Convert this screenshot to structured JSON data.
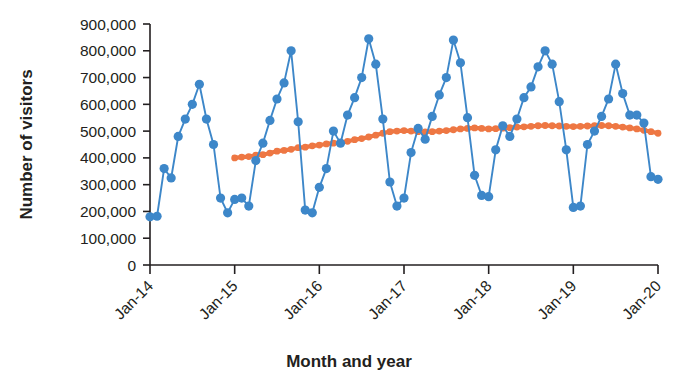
{
  "chart_data": {
    "type": "line",
    "title": "",
    "xlabel": "Month and year",
    "ylabel": "Number of visitors",
    "ylim": [
      0,
      900000
    ],
    "ytick_values": [
      0,
      100000,
      200000,
      300000,
      400000,
      500000,
      600000,
      700000,
      800000,
      900000
    ],
    "ytick_labels": [
      "0",
      "100,000",
      "200,000",
      "300,000",
      "400,000",
      "500,000",
      "600,000",
      "700,000",
      "800,000",
      "900,000"
    ],
    "xtick_labels": [
      "Jan-14",
      "Jan-15",
      "Jan-16",
      "Jan-17",
      "Jan-18",
      "Jan-19",
      "Jan-20"
    ],
    "xtick_indices": [
      0,
      12,
      24,
      36,
      48,
      60,
      72
    ],
    "grid": false,
    "legend": "none",
    "x_start_label": "Jan-14",
    "x_end_label": "Jan-20",
    "colors": {
      "series_visitors": "#3d87c9",
      "series_trend": "#ee7743",
      "axis": "#231f20",
      "background": "#ffffff"
    },
    "series": [
      {
        "name": "Number of visitors",
        "type": "line-marker",
        "color": "#3d87c9",
        "marker": "circle",
        "values": [
          180000,
          182000,
          360000,
          325000,
          480000,
          545000,
          600000,
          675000,
          545000,
          450000,
          250000,
          195000,
          245000,
          250000,
          220000,
          390000,
          455000,
          540000,
          620000,
          680000,
          800000,
          535000,
          205000,
          195000,
          290000,
          360000,
          500000,
          455000,
          560000,
          625000,
          700000,
          845000,
          750000,
          545000,
          310000,
          220000,
          250000,
          420000,
          510000,
          470000,
          555000,
          635000,
          700000,
          840000,
          755000,
          550000,
          335000,
          260000,
          255000,
          430000,
          520000,
          480000,
          545000,
          625000,
          665000,
          740000,
          800000,
          750000,
          610000,
          430000,
          215000,
          220000,
          450000,
          500000,
          555000,
          620000,
          750000,
          640000,
          560000,
          560000,
          530000,
          330000,
          320000
        ]
      },
      {
        "name": "Trend (12-month moving average)",
        "type": "line-marker",
        "color": "#ee7743",
        "marker": "circle",
        "start_index": 12,
        "values": [
          400000,
          403000,
          405000,
          410000,
          412000,
          418000,
          425000,
          428000,
          432000,
          438000,
          440000,
          445000,
          448000,
          452000,
          455000,
          458000,
          462000,
          468000,
          472000,
          478000,
          485000,
          492000,
          498000,
          500000,
          502000,
          500000,
          498000,
          497000,
          498000,
          500000,
          502000,
          505000,
          508000,
          510000,
          512000,
          510000,
          508000,
          509000,
          511000,
          513000,
          515000,
          516000,
          518000,
          520000,
          521000,
          520000,
          519000,
          518000,
          517000,
          518000,
          519000,
          520000,
          521000,
          520000,
          518000,
          515000,
          512000,
          508000,
          503000,
          498000,
          492000
        ]
      }
    ]
  }
}
